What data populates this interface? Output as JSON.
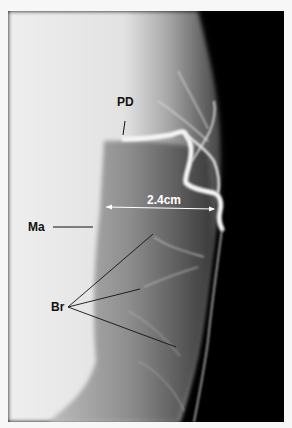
{
  "figure": {
    "type": "angiogram",
    "colors": {
      "background_page": "#f7f7f7",
      "tissue_light": "#ececec",
      "tissue_mid": "#9a9a9a",
      "dark_field": "#050505",
      "vessel": "#f2f2f2"
    }
  },
  "annotations": {
    "pd": {
      "label": "PD"
    },
    "ma": {
      "label": "Ma"
    },
    "br": {
      "label": "Br"
    },
    "measurement": {
      "label": "2.4cm"
    }
  }
}
